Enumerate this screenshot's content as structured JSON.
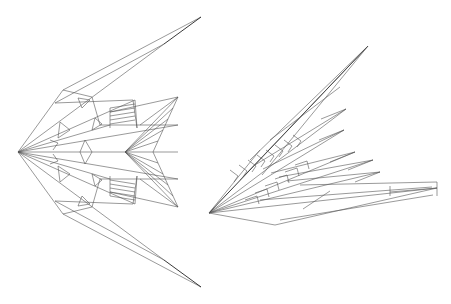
{
  "canvas": {
    "width": 451,
    "height": 304,
    "background": "#ffffff",
    "stroke": "#555555"
  },
  "figures": [
    {
      "name": "symmetric-fold-pattern",
      "apex": [
        18,
        152
      ],
      "top_tip": [
        201,
        17
      ],
      "bottom_tip": [
        201,
        289
      ],
      "chevron": {
        "apex": [
          125,
          152
        ],
        "top": [
          178,
          97
        ],
        "bottom": [
          178,
          210
        ],
        "notch": [
          153,
          152
        ]
      }
    },
    {
      "name": "asymmetric-fold-pattern",
      "apex": [
        209,
        213
      ],
      "top_tip": [
        368,
        46
      ],
      "right_tip": [
        437,
        188
      ],
      "mid_tips": [
        [
          346,
          109
        ],
        [
          344,
          130
        ],
        [
          355,
          152
        ],
        [
          373,
          160
        ],
        [
          380,
          172
        ]
      ]
    }
  ]
}
